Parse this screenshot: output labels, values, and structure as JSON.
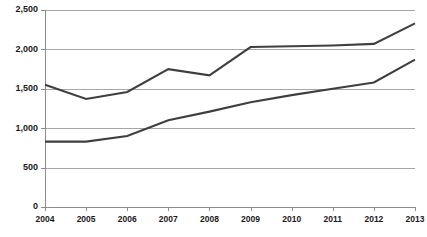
{
  "chart_data": {
    "type": "line",
    "title": "",
    "subtitle": "",
    "xlabel": "",
    "ylabel": "",
    "categories": [
      "2004",
      "2005",
      "2006",
      "2007",
      "2008",
      "2009",
      "2010",
      "2011",
      "2012",
      "2013"
    ],
    "x": [
      2004,
      2005,
      2006,
      2007,
      2008,
      2009,
      2010,
      2011,
      2012,
      2013
    ],
    "series": [
      {
        "name": "upper-series",
        "color": "#3f3f3f",
        "values": [
          1550,
          1370,
          1460,
          1750,
          1670,
          2030,
          2040,
          2050,
          2070,
          2330
        ]
      },
      {
        "name": "lower-series",
        "color": "#3f3f3f",
        "values": [
          830,
          830,
          900,
          1100,
          1210,
          1330,
          1420,
          1500,
          1580,
          1870
        ]
      }
    ],
    "ylim": [
      0,
      2500
    ],
    "ytick_values": [
      0,
      500,
      1000,
      1500,
      2000,
      2500
    ],
    "ytick_labels": [
      "0",
      "500",
      "1,000",
      "1,500",
      "2,000",
      "2,500"
    ],
    "xtick_labels": [
      "2004",
      "2005",
      "2006",
      "2007",
      "2008",
      "2009",
      "2010",
      "2011",
      "2012",
      "2013"
    ],
    "grid": true,
    "grid_axis": "y",
    "grid_color": "#a6a6a6",
    "legend": false,
    "legend_position": "none",
    "annotations": [],
    "background_color": "#ffffff",
    "axis_color": "#8c8c8c"
  },
  "plot": {
    "left": 45,
    "right": 415,
    "top": 10,
    "bottom": 207
  }
}
